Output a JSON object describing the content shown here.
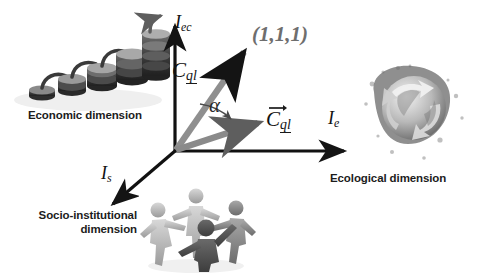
{
  "diagram": {
    "background_color": "#ffffff"
  },
  "axes": [
    {
      "id": "economic",
      "label": "I_ec",
      "label_base": "I",
      "label_sub": "ec",
      "direction": "up",
      "color": "#111111"
    },
    {
      "id": "ecological",
      "label": "I_e",
      "label_base": "I",
      "label_sub": "e",
      "direction": "right",
      "color": "#111111"
    },
    {
      "id": "socio_institutional",
      "label": "I_s",
      "label_base": "I",
      "label_sub": "s",
      "direction": "down-left",
      "color": "#111111"
    }
  ],
  "vectors": [
    {
      "id": "cql-ideal",
      "label_base": "C",
      "label_sub": "ql",
      "points_to": "(1,1,1)",
      "color": "#8f8f8f",
      "arrowhead_color": "#141414"
    },
    {
      "id": "cql-actual",
      "label_base": "C",
      "label_sub": "ql",
      "has_vector_bar": true,
      "color": "#8a8a8a",
      "arrowhead_color": "#5a5a5a"
    }
  ],
  "labels": {
    "ideal_point": "(1,1,1)",
    "ideal_point_color": "#6e6e6e",
    "angle_symbol": "α"
  },
  "captions": {
    "economic": "Economic dimension",
    "ecological": "Ecological dimension",
    "socio_institutional_line1": "Socio-institutional",
    "socio_institutional_line2": "dimension"
  },
  "imagery": [
    {
      "id": "coins-photo",
      "name": "coin-stacks-growth-photo",
      "description": "grayscale ascending stacks of coins with rising arrow"
    },
    {
      "id": "globe-photo",
      "name": "globe-recycling-photo",
      "description": "grayscale globe with recycling arrows and ink splatter"
    },
    {
      "id": "people-photo",
      "name": "people-circle-photo",
      "description": "grayscale stylized human figures holding hands in a circle"
    }
  ]
}
